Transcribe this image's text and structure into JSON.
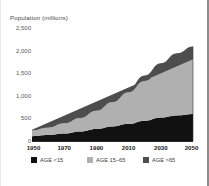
{
  "chart_data": {
    "type": "area",
    "title": "",
    "ylabel": "Population (millions)",
    "xlabel": "",
    "stacked": true,
    "grid": false,
    "legend_position": "bottom",
    "x": [
      1950,
      1960,
      1970,
      1980,
      1990,
      2000,
      2010,
      2020,
      2030,
      2040,
      2050
    ],
    "xticks": [
      "1950",
      "1970",
      "1990",
      "2010",
      "2030",
      "2050"
    ],
    "xtick_values": [
      1950,
      1970,
      1990,
      2010,
      2030,
      2050
    ],
    "yticks": [
      "0",
      "500",
      "1,000",
      "1,500",
      "2,000",
      "2,500"
    ],
    "ytick_values": [
      0,
      500,
      1000,
      1500,
      2000,
      2500
    ],
    "ylim": [
      0,
      2500
    ],
    "xlim": [
      1950,
      2050
    ],
    "series": [
      {
        "name": "AGE <15",
        "color": "#111111",
        "values": [
          105,
          130,
          165,
          210,
          265,
          320,
          380,
          450,
          520,
          570,
          600
        ]
      },
      {
        "name": "AGE 15–65",
        "color": "#b0b0b0",
        "values": [
          130,
          165,
          225,
          300,
          405,
          540,
          700,
          880,
          1030,
          1140,
          1210
        ]
      },
      {
        "name": "AGE >65",
        "color": "#4d4d4d",
        "values": [
          15,
          19,
          25,
          33,
          45,
          62,
          85,
          120,
          170,
          230,
          280
        ]
      }
    ],
    "totals": [
      250,
      314,
      415,
      543,
      715,
      922,
      1165,
      1450,
      1720,
      1940,
      2090
    ]
  },
  "legend": {
    "items": [
      {
        "label": "AGE <15",
        "color": "#111111"
      },
      {
        "label": "AGE 15–65",
        "color": "#b0b0b0"
      },
      {
        "label": "AGE >65",
        "color": "#4d4d4d"
      }
    ]
  },
  "axis": {
    "ylabel": "Population (millions)"
  }
}
